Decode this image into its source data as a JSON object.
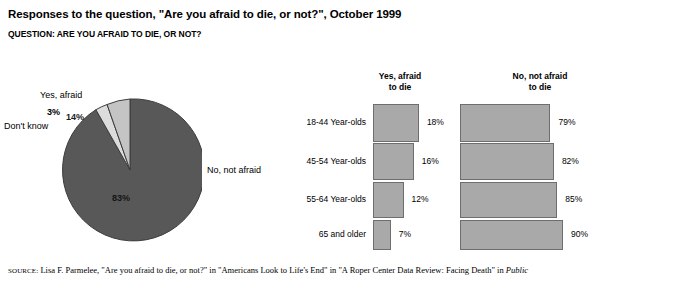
{
  "title": "Responses to the question, \"Are you afraid to die, or not?\", October 1999",
  "question": "QUESTION: ARE YOU AFRAID TO DIE, OR NOT?",
  "source": {
    "label": "SOURCE:",
    "text": " Lisa F. Parmelee, \"Are you afraid to die, or not?\" in \"Americans Look to Life's End\" in \"A Roper Center Data Review: Facing Death\" in ",
    "italic": "Public"
  },
  "colors": {
    "slice_dark": "#585858",
    "slice_light": "#c4c4c4",
    "slice_lightest": "#dcdcdc",
    "bar_fill": "#a9a9a9",
    "bar_border": "#6e6e6e",
    "outline": "#3c3c3c"
  },
  "chart_data": [
    {
      "type": "pie",
      "title": "Responses to the question, \"Are you afraid to die, or not?\", October 1999",
      "categories": [
        "Yes, afraid",
        "Don't know",
        "No, not afraid"
      ],
      "values": [
        14,
        3,
        83
      ],
      "value_labels": [
        "14%",
        "3%",
        "83%"
      ],
      "unit": "percent",
      "legend": "labels-attached-to-slices"
    },
    {
      "type": "bar",
      "orientation": "horizontal",
      "title": "Afraid to die by age group",
      "categories": [
        "18-44 Year-olds",
        "45-54 Year-olds",
        "55-64 Year-olds",
        "65 and older"
      ],
      "series": [
        {
          "name": "Yes, afraid to die",
          "values": [
            18,
            16,
            12,
            7
          ],
          "value_labels": [
            "18%",
            "16%",
            "12%",
            "7%"
          ]
        },
        {
          "name": "No, not afraid to die",
          "values": [
            79,
            82,
            85,
            90
          ],
          "value_labels": [
            "79%",
            "82%",
            "85%",
            "90%"
          ]
        }
      ],
      "xlabel": "",
      "ylabel": "",
      "unit": "percent",
      "grid": false,
      "legend": "column-headers"
    }
  ],
  "pie": {
    "label_yes": "Yes, afraid",
    "label_dontknow": "Don't know",
    "label_no": "No, not afraid",
    "value_yes": "14%",
    "value_dontknow": "3%",
    "value_no": "83%"
  },
  "bars": {
    "header_yes_line1": "Yes, afraid",
    "header_yes_line2": "to die",
    "header_no_line1": "No, not afraid",
    "header_no_line2": "to die",
    "rows": [
      {
        "label": "18-44 Year-olds",
        "yes": "18%",
        "no": "79%"
      },
      {
        "label": "45-54 Year-olds",
        "yes": "16%",
        "no": "82%"
      },
      {
        "label": "55-64 Year-olds",
        "yes": "12%",
        "no": "85%"
      },
      {
        "label": "65 and older",
        "yes": "7%",
        "no": "90%"
      }
    ]
  }
}
